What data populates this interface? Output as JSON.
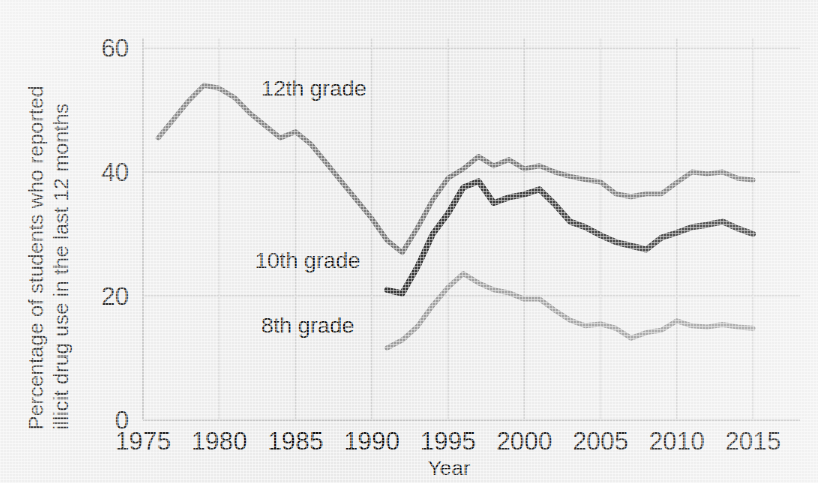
{
  "chart_data": {
    "type": "line",
    "title": "",
    "xlabel": "Year",
    "ylabel": "Percentage of students who reported illicit drug use in the last 12 months",
    "ylabel_line1": "Percentage of students who reported",
    "ylabel_line2": "illicit drug use in the last 12 months",
    "xlim": [
      1975,
      2015
    ],
    "ylim": [
      0,
      60
    ],
    "xticks": [
      "1975",
      "1980",
      "1985",
      "1990",
      "1995",
      "2000",
      "2005",
      "2010",
      "2015"
    ],
    "xtick_values": [
      1975,
      1980,
      1985,
      1990,
      1995,
      2000,
      2005,
      2010,
      2015
    ],
    "yticks": [
      "0",
      "20",
      "40",
      "60"
    ],
    "ytick_values": [
      0,
      20,
      40,
      60
    ],
    "grid": true,
    "legend_position": "inline-annotations",
    "colors": {
      "grade12": "#7c7c7c",
      "grade10": "#3b3b3b",
      "grade8": "#a0a0a0",
      "background": "#eeeeee",
      "gridline": "#d6d6d6",
      "text": "#111111"
    },
    "series": [
      {
        "name": "12th grade",
        "label": "12th grade",
        "color": "#7c7c7c",
        "label_x": 1986.2,
        "label_y": 52.2,
        "x": [
          1976,
          1977,
          1978,
          1979,
          1980,
          1981,
          1982,
          1983,
          1984,
          1985,
          1986,
          1987,
          1988,
          1989,
          1990,
          1991,
          1992,
          1993,
          1994,
          1995,
          1996,
          1997,
          1998,
          1999,
          2000,
          2001,
          2002,
          2003,
          2004,
          2005,
          2006,
          2007,
          2008,
          2009,
          2010,
          2011,
          2012,
          2013,
          2014,
          2015
        ],
        "values": [
          45.5,
          48.5,
          51.5,
          54.0,
          53.5,
          52.0,
          49.5,
          47.5,
          45.5,
          46.5,
          44.5,
          41.5,
          38.5,
          35.5,
          32.5,
          29.0,
          27.0,
          31.0,
          35.5,
          39.0,
          40.5,
          42.5,
          41.0,
          42.0,
          40.5,
          41.0,
          40.0,
          39.3,
          38.8,
          38.4,
          36.5,
          36.0,
          36.5,
          36.5,
          38.3,
          40.0,
          39.7,
          40.0,
          39.0,
          38.7
        ]
      },
      {
        "name": "10th grade",
        "label": "10th grade",
        "color": "#3b3b3b",
        "label_x": 1985.8,
        "label_y": 24.5,
        "x": [
          1991,
          1992,
          1993,
          1994,
          1995,
          1996,
          1997,
          1998,
          1999,
          2000,
          2001,
          2002,
          2003,
          2004,
          2005,
          2006,
          2007,
          2008,
          2009,
          2010,
          2011,
          2012,
          2013,
          2014,
          2015
        ],
        "values": [
          21.0,
          20.4,
          24.7,
          30.0,
          33.3,
          37.5,
          38.5,
          35.0,
          35.9,
          36.4,
          37.2,
          34.8,
          32.0,
          31.1,
          29.8,
          28.7,
          28.1,
          27.5,
          29.4,
          30.2,
          31.1,
          31.5,
          32.0,
          30.9,
          30.0
        ]
      },
      {
        "name": "8th grade",
        "label": "8th grade",
        "color": "#a0a0a0",
        "label_x": 1985.8,
        "label_y": 14.0,
        "x": [
          1991,
          1992,
          1993,
          1994,
          1995,
          1996,
          1997,
          1998,
          1999,
          2000,
          2001,
          2002,
          2003,
          2004,
          2005,
          2006,
          2007,
          2008,
          2009,
          2010,
          2011,
          2012,
          2013,
          2014,
          2015
        ],
        "values": [
          11.6,
          12.9,
          15.1,
          18.5,
          21.4,
          23.6,
          22.1,
          21.0,
          20.5,
          19.5,
          19.5,
          17.7,
          16.1,
          15.2,
          15.5,
          14.8,
          13.2,
          14.1,
          14.5,
          16.0,
          15.2,
          15.0,
          15.4,
          15.0,
          14.8
        ]
      }
    ]
  },
  "axis": {
    "x_title": "Year",
    "y_title_line1": "Percentage of students who reported",
    "y_title_line2": "illicit drug use in the last 12 months"
  }
}
